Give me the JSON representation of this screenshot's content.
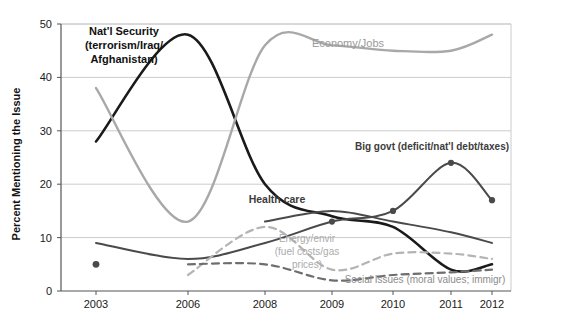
{
  "chart_data": {
    "type": "line",
    "title": "",
    "xlabel": "",
    "ylabel": "Percent Mentioning the Issue",
    "x": [
      2003,
      2006,
      2008,
      2009,
      2010,
      2011,
      2012
    ],
    "xtick_labels": [
      "2003",
      "2006",
      "2008",
      "2009",
      "2010",
      "2011",
      "2012"
    ],
    "ytick_labels": [
      "0",
      "10",
      "20",
      "30",
      "40",
      "50"
    ],
    "yticks": [
      0,
      10,
      20,
      30,
      40,
      50
    ],
    "ylim": [
      0,
      50
    ],
    "xlim": [
      2003,
      2012
    ],
    "grid": "horizontal",
    "legend": "inline-annotations",
    "series": [
      {
        "name": "Nat'l Security (terrorism/Iraq/Afghanistan)",
        "label": "Nat'l Security\n(terrorism/Iraq/\nAfghanistan)",
        "color": "#1a1a1a",
        "style": "solid",
        "width": 2.6,
        "markers": false,
        "values": [
          28,
          48,
          20,
          14,
          12,
          4,
          5
        ]
      },
      {
        "name": "Economy/Jobs",
        "label": "Economy/Jobs",
        "color": "#a8a8a8",
        "style": "solid",
        "width": 2.4,
        "markers": false,
        "values": [
          38,
          13,
          46,
          46,
          45,
          45,
          48
        ]
      },
      {
        "name": "Big govt (deficit/nat'l debt/taxes)",
        "label": "Big govt (deficit/nat'l debt/taxes)",
        "color": "#4a4a4a",
        "style": "solid",
        "width": 2.0,
        "markers": true,
        "values": [
          9,
          6,
          9,
          13,
          15,
          24,
          17
        ],
        "marker_points": [
          {
            "x": 2009,
            "y": 13
          },
          {
            "x": 2010,
            "y": 15
          },
          {
            "x": 2011,
            "y": 24
          },
          {
            "x": 2012,
            "y": 17
          }
        ]
      },
      {
        "name": "Health care",
        "label": "Health care",
        "color": "#4a4a4a",
        "style": "solid",
        "width": 2.0,
        "markers": false,
        "values": [
          null,
          null,
          13,
          15,
          13,
          11,
          9
        ]
      },
      {
        "name": "Energy/envir (fuel costs/gas prices)",
        "label": "Energy/envir\n(fuel costs/gas\nprices)",
        "color": "#b4b4b4",
        "style": "dashed",
        "width": 2.2,
        "markers": false,
        "values": [
          null,
          3,
          12,
          4,
          7,
          7,
          6
        ]
      },
      {
        "name": "Social Issues (moral values; immigr)",
        "label": "Social Issues (moral values; immigr)",
        "color": "#6e6e6e",
        "style": "dashed",
        "width": 2.2,
        "markers": false,
        "values": [
          null,
          5,
          5,
          2,
          3,
          3.5,
          4
        ]
      }
    ],
    "isolated_points": [
      {
        "x": 2003,
        "y": 5,
        "color": "#4a4a4a",
        "series": "Big govt (deficit/nat'l debt/taxes)"
      }
    ],
    "annotations": [
      {
        "name": "natl-security",
        "lines": [
          "Nat'l Security",
          "(terrorism/Iraq/",
          "Afghanistan)"
        ],
        "color": "#111111",
        "bold": true,
        "size": 11,
        "x": 124,
        "y": 35,
        "anchor": "middle"
      },
      {
        "name": "economy-jobs",
        "lines": [
          "Economy/Jobs"
        ],
        "color": "#999999",
        "bold": false,
        "size": 11,
        "x": 348,
        "y": 47,
        "anchor": "middle"
      },
      {
        "name": "big-govt",
        "lines": [
          "Big govt (deficit/nat'l debt/taxes)"
        ],
        "color": "#3c3c3c",
        "bold": true,
        "size": 10,
        "x": 432,
        "y": 150,
        "anchor": "middle"
      },
      {
        "name": "health-care",
        "lines": [
          "Health care"
        ],
        "color": "#3c3c3c",
        "bold": true,
        "size": 10.5,
        "x": 277,
        "y": 203,
        "anchor": "middle"
      },
      {
        "name": "energy-envir",
        "lines": [
          "Energy/envir",
          "(fuel costs/gas",
          "prices)"
        ],
        "color": "#ababab",
        "bold": false,
        "size": 10,
        "x": 307,
        "y": 242,
        "anchor": "middle"
      },
      {
        "name": "social-issues",
        "lines": [
          "Social Issues (moral values; immigr)"
        ],
        "color": "#8c8c8c",
        "bold": false,
        "size": 10,
        "x": 425,
        "y": 283,
        "anchor": "middle"
      }
    ],
    "colors": {
      "background": "#ffffff",
      "grid": "#cccccc",
      "axis": "#555555",
      "text": "#1a1a1a"
    }
  }
}
